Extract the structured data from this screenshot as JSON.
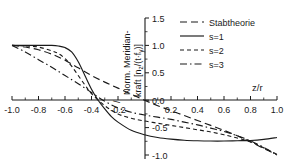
{
  "chart_data": {
    "type": "line",
    "title": "",
    "xlabel": "z/r",
    "ylabel": "Norm. Meridian-kraft [n_z/(t·f_y)]",
    "ylabel_line1": "Norm. Meridian-",
    "ylabel_line2_prefix": "kraft [n",
    "ylabel_line2_sub1": "z",
    "ylabel_line2_mid": "/(t·f",
    "ylabel_line2_sub2": "y",
    "ylabel_line2_suffix": ")]",
    "xlim": [
      -1.0,
      1.0
    ],
    "ylim": [
      -1.0,
      1.5
    ],
    "grid": false,
    "legend_position": "top-right",
    "xticks": [
      -1.0,
      -0.8,
      -0.6,
      -0.4,
      -0.2,
      0.2,
      0.4,
      0.6,
      0.8,
      1.0
    ],
    "xtick_labels": [
      "-1.0",
      "-0.8",
      "-0.6",
      "-0.4",
      "-0.2",
      "0.2",
      "0.4",
      "0.6",
      "0.8",
      "1.0"
    ],
    "yticks": [
      1.5,
      1.0,
      0.5,
      0.0,
      -0.5,
      -1.0
    ],
    "ytick_labels": [
      "1.5",
      "1.0",
      "0.5",
      "0.0",
      "-0.5",
      "-1.0"
    ],
    "series": [
      {
        "name": "Stabtheorie",
        "style": "dashed-long",
        "dasharray": "7,4",
        "color": "#1a1a1a",
        "x": [
          -1.0,
          -0.9,
          -0.8,
          -0.7,
          -0.6,
          -0.5,
          -0.4,
          -0.3,
          -0.2,
          -0.1,
          0.0,
          0.1,
          0.2,
          0.3,
          0.4,
          0.5,
          0.6,
          0.7,
          0.8,
          0.9,
          1.0
        ],
        "y": [
          1.0,
          0.97,
          0.92,
          0.84,
          0.73,
          0.59,
          0.45,
          0.33,
          0.22,
          0.11,
          0.0,
          -0.1,
          -0.19,
          -0.28,
          -0.37,
          -0.46,
          -0.55,
          -0.65,
          -0.76,
          -0.88,
          -1.0
        ]
      },
      {
        "name": "s=1",
        "style": "solid",
        "dasharray": "none",
        "color": "#1a1a1a",
        "x": [
          -1.0,
          -0.9,
          -0.8,
          -0.7,
          -0.65,
          -0.6,
          -0.55,
          -0.5,
          -0.45,
          -0.4,
          -0.35,
          -0.3,
          -0.25,
          -0.2,
          -0.1,
          0.0,
          0.1,
          0.2,
          0.3,
          0.4,
          0.5,
          0.6,
          0.7,
          0.8,
          0.9,
          1.0
        ],
        "y": [
          1.0,
          1.0,
          1.0,
          1.0,
          0.99,
          0.96,
          0.88,
          0.7,
          0.45,
          0.2,
          0.0,
          -0.16,
          -0.3,
          -0.4,
          -0.55,
          -0.63,
          -0.68,
          -0.71,
          -0.73,
          -0.74,
          -0.745,
          -0.745,
          -0.74,
          -0.735,
          -0.715,
          -0.68
        ]
      },
      {
        "name": "s=2",
        "style": "dashed-short",
        "dasharray": "4,3",
        "color": "#1a1a1a",
        "x": [
          -1.0,
          -0.9,
          -0.8,
          -0.7,
          -0.65,
          -0.6,
          -0.55,
          -0.5,
          -0.45,
          -0.4,
          -0.3,
          -0.2,
          -0.1,
          0.0,
          0.1,
          0.2,
          0.3,
          0.4,
          0.5,
          0.6,
          0.7,
          0.8,
          0.9,
          1.0
        ],
        "y": [
          1.0,
          0.99,
          0.97,
          0.9,
          0.85,
          0.76,
          0.62,
          0.45,
          0.28,
          0.12,
          -0.1,
          -0.25,
          -0.33,
          -0.38,
          -0.42,
          -0.46,
          -0.5,
          -0.54,
          -0.58,
          -0.63,
          -0.69,
          -0.76,
          -0.87,
          -0.99
        ]
      },
      {
        "name": "s=3",
        "style": "dash-dot",
        "dasharray": "7,3,1.5,3",
        "color": "#1a1a1a",
        "x": [
          -1.0,
          -0.9,
          -0.8,
          -0.7,
          -0.6,
          -0.5,
          -0.4,
          -0.3,
          -0.2,
          -0.1,
          0.0,
          0.1,
          0.2,
          0.3,
          0.4,
          0.5,
          0.6,
          0.7,
          0.8,
          0.9,
          1.0
        ],
        "y": [
          1.0,
          0.88,
          0.74,
          0.6,
          0.45,
          0.3,
          0.14,
          -0.02,
          -0.14,
          -0.22,
          -0.27,
          -0.31,
          -0.35,
          -0.4,
          -0.45,
          -0.51,
          -0.57,
          -0.65,
          -0.74,
          -0.86,
          -1.0
        ]
      }
    ]
  },
  "legend": {
    "entries": [
      {
        "label": "Stabtheorie"
      },
      {
        "label": "s=1"
      },
      {
        "label": "s=2"
      },
      {
        "label": "s=3"
      }
    ]
  },
  "axes": {
    "x_axis_title": "z/r",
    "y_axis_title_line1": "Norm. Meridian-",
    "y_axis_title_line2": "kraft [nz/(t·fy)]"
  }
}
